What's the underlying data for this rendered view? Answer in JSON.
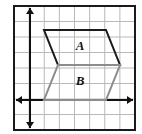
{
  "figure": {
    "background_color": "#ffffff",
    "frame": {
      "left": 14,
      "top": 6,
      "right": 135,
      "bottom": 130,
      "border_color": "#1a1a1a",
      "border_width": 2
    },
    "grid": {
      "cell_size": 15.2,
      "line_color": "#b9b9b9",
      "line_width": 1,
      "columns": 8,
      "rows": 8,
      "visible": true
    },
    "axes": {
      "color": "#111111",
      "width": 2,
      "x_axis": {
        "name": "x-axis",
        "y": 100,
        "x_start": 16,
        "x_end": 133,
        "arrows": "both"
      },
      "y_axis": {
        "name": "y-axis",
        "x": 30,
        "y_start": 8,
        "y_end": 128,
        "arrows": "both"
      }
    },
    "shapes": [
      {
        "name": "shape-a",
        "label": "A",
        "type": "parallelogram",
        "stroke": "#1a1a1a",
        "stroke_width": 2,
        "fill": "none",
        "points": "44,30 106,30 120,65 58,65",
        "label_x": 80,
        "label_y": 50
      },
      {
        "name": "shape-b",
        "label": "B",
        "type": "parallelogram",
        "stroke": "#8c8c8c",
        "stroke_width": 2,
        "fill": "none",
        "points": "58,65 120,65 106,100 44,100",
        "label_x": 80,
        "label_y": 85
      }
    ],
    "label_color": "#111111",
    "label_font_size": 13
  }
}
